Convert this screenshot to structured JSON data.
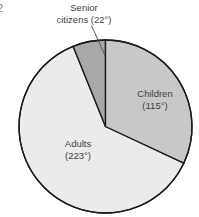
{
  "figure": {
    "number": "2",
    "background_color": "#ffffff",
    "outline_color": "#1a1a1a"
  },
  "chart_data": {
    "type": "pie",
    "title": "",
    "xlabel": "",
    "ylabel": "",
    "units": "degrees",
    "total_degrees": 360,
    "start_angle_deg": 0,
    "direction": "clockwise",
    "legend_position": "none",
    "grid": false,
    "categories": [
      "Children",
      "Adults",
      "Senior citizens"
    ],
    "values": [
      115,
      223,
      22
    ],
    "slices": [
      {
        "name": "Children",
        "label_line1": "Children",
        "label_line2": "(115°)",
        "value_deg": 115,
        "percent": 31.9,
        "color": "#c8c8c8",
        "has_leader_line": false
      },
      {
        "name": "Adults",
        "label_line1": "Adults",
        "label_line2": "(223°)",
        "value_deg": 223,
        "percent": 61.9,
        "color": "#ebebeb",
        "has_leader_line": false
      },
      {
        "name": "Senior citizens",
        "label_line1": "Senior",
        "label_line2": "citizens (22°)",
        "value_deg": 22,
        "percent": 6.1,
        "color": "#a8a8a8",
        "has_leader_line": true
      }
    ]
  }
}
